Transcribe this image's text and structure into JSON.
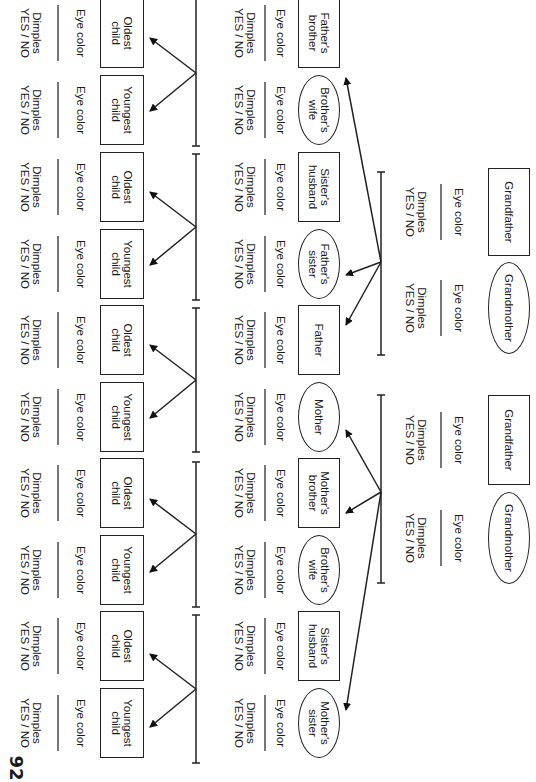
{
  "worksheet": {
    "page_number": "92",
    "orientation": "rotated 90 degrees clockwise",
    "field_labels": {
      "eye_color": "Eye color",
      "dimples_line1": "Dimples",
      "dimples_line2": "YES / NO"
    },
    "generation_1": [
      {
        "id": "paternal-grandfather",
        "label": "Grandfather",
        "shape": "box"
      },
      {
        "id": "paternal-grandmother",
        "label": "Grandmother",
        "shape": "oval"
      },
      {
        "id": "maternal-grandfather",
        "label": "Grandfather",
        "shape": "box"
      },
      {
        "id": "maternal-grandmother",
        "label": "Grandmother",
        "shape": "oval"
      }
    ],
    "generation_2": [
      {
        "id": "fathers-brother",
        "label_line1": "Father's",
        "label_line2": "brother",
        "shape": "box"
      },
      {
        "id": "fathers-brothers-wife",
        "label_line1": "Brother's",
        "label_line2": "wife",
        "shape": "oval"
      },
      {
        "id": "fathers-sisters-husband",
        "label_line1": "Sister's",
        "label_line2": "husband",
        "shape": "box"
      },
      {
        "id": "fathers-sister",
        "label_line1": "Father's",
        "label_line2": "sister",
        "shape": "oval"
      },
      {
        "id": "father",
        "label_line1": "Father",
        "label_line2": "",
        "shape": "box"
      },
      {
        "id": "mother",
        "label_line1": "Mother",
        "label_line2": "",
        "shape": "oval"
      },
      {
        "id": "mothers-brother",
        "label_line1": "Mother's",
        "label_line2": "brother",
        "shape": "box"
      },
      {
        "id": "mothers-brothers-wife",
        "label_line1": "Brother's",
        "label_line2": "wife",
        "shape": "oval"
      },
      {
        "id": "mothers-sisters-husband",
        "label_line1": "Sister's",
        "label_line2": "husband",
        "shape": "box"
      },
      {
        "id": "mothers-sister",
        "label_line1": "Mother's",
        "label_line2": "sister",
        "shape": "oval"
      }
    ],
    "generation_3": [
      {
        "label_line1": "Oldest",
        "label_line2": "child"
      },
      {
        "label_line1": "Youngest",
        "label_line2": "child"
      },
      {
        "label_line1": "Oldest",
        "label_line2": "child"
      },
      {
        "label_line1": "Youngest",
        "label_line2": "child"
      },
      {
        "label_line1": "Oldest",
        "label_line2": "child"
      },
      {
        "label_line1": "Youngest",
        "label_line2": "child"
      },
      {
        "label_line1": "Oldest",
        "label_line2": "child"
      },
      {
        "label_line1": "Youngest",
        "label_line2": "child"
      },
      {
        "label_line1": "Oldest",
        "label_line2": "child"
      },
      {
        "label_line1": "Youngest",
        "label_line2": "child"
      }
    ]
  }
}
